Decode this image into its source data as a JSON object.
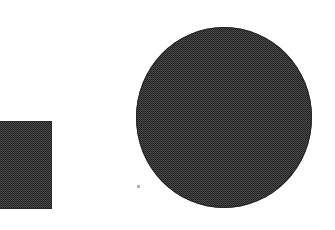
{
  "canvas": {
    "width": 335,
    "height": 230,
    "background_color": "#ffffff",
    "description": "Scanned page with two dark halftone-shaded geometric shapes on a white field"
  },
  "palette": {
    "background": "#ffffff",
    "shape_fill": "#3a3a3a",
    "shape_outline": "#242424",
    "speck": "#b4b4b4"
  },
  "shapes": [
    {
      "id": "square",
      "name": "square",
      "label": "Square",
      "fill": "#3a3a3a",
      "outline": "#2a2a2a",
      "texture": "halftone-dither",
      "clipped_at": "left-edge",
      "x": 0,
      "y": 121,
      "width": 52,
      "height": 88
    },
    {
      "id": "circle",
      "name": "circle",
      "label": "Circle",
      "fill": "#3a3a3a",
      "outline": "#242424",
      "texture": "halftone-dither",
      "clipped_at": "none",
      "x": 136,
      "y": 27,
      "width": 176,
      "height": 181
    }
  ],
  "artifacts": [
    {
      "id": "speck",
      "name": "scan-speck",
      "label": "Scan speck",
      "color": "#b4b4b4",
      "x": 137,
      "y": 185,
      "width": 3,
      "height": 3
    }
  ]
}
